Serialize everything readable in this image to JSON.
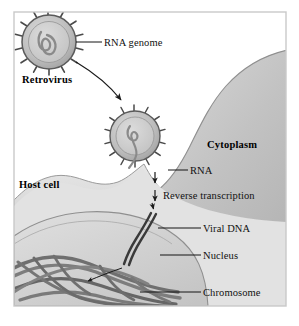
{
  "figure": {
    "frame_color": "#c9c9c9",
    "background_color": "#ffffff"
  },
  "palette": {
    "cytoplasm_fill": "#c8c8c8",
    "cytoplasm_edge": "#8d8d8d",
    "hostcell_fill": "#dcdcdc",
    "hostcell_edge": "#9a9a9a",
    "nucleus_fill": "#d2d2d2",
    "nucleus_edge": "#8f8f8f",
    "capsid_fill": "#b9b9b9",
    "capsid_core": "#cccccc",
    "spike_color": "#4a4a4a",
    "rna_color": "#8a8a8a",
    "dna_color": "#3c3c3c",
    "chromosome_color": "#707070",
    "label_color": "#111111",
    "arrow_color": "#1a1a1a"
  },
  "labels": {
    "rna_genome": "RNA genome",
    "retrovirus": "Retrovirus",
    "cytoplasm": "Cytoplasm",
    "host_cell": "Host cell",
    "rna": "RNA",
    "reverse_transcription": "Reverse transcription",
    "viral_dna": "Viral DNA",
    "nucleus": "Nucleus",
    "chromosome": "Chromosome"
  },
  "icons": {
    "virus_particle": "virus-particle-icon",
    "virus_particle_fusing": "virus-particle-fusing-icon",
    "rna_strand": "rna-strand-icon",
    "dna_duplex": "dna-duplex-icon",
    "chromosome_tangle": "chromosome-tangle-icon",
    "entry_arrow": "curved-entry-arrow-icon",
    "integration_arrow": "curved-integration-arrow-icon",
    "down_arrow": "down-arrow-icon"
  },
  "steps": [
    {
      "order": 1,
      "label": "RNA genome",
      "description": "Retrovirus carries an RNA genome inside its capsid"
    },
    {
      "order": 2,
      "label": "Retrovirus",
      "description": "Free retrovirus particle approaches the host cell"
    },
    {
      "order": 3,
      "label": "Cytoplasm",
      "description": "Virus fuses with the host cell plasma membrane"
    },
    {
      "order": 4,
      "label": "RNA",
      "description": "Viral RNA is released into the cytoplasm"
    },
    {
      "order": 5,
      "label": "Reverse transcription",
      "description": "Viral RNA is reverse transcribed"
    },
    {
      "order": 6,
      "label": "Viral DNA",
      "description": "Double-stranded viral DNA is produced"
    },
    {
      "order": 7,
      "label": "Nucleus",
      "description": "Viral DNA moves into the nucleus"
    },
    {
      "order": 8,
      "label": "Chromosome",
      "description": "Viral DNA integrates into the host chromosome"
    }
  ]
}
